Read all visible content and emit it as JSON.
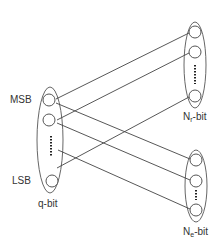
{
  "diagram": {
    "labels": {
      "msb": "MSB",
      "lsb": "LSB",
      "q_group": "q-bit",
      "nr_main": "N",
      "nr_sub": "r",
      "nr_suffix": "-bit",
      "ne_main": "N",
      "ne_sub": "e",
      "ne_suffix": "-bit"
    },
    "colors": {
      "stroke": "#555555",
      "line": "#444444",
      "text": "#333333",
      "background": "#ffffff"
    },
    "groups": [
      {
        "id": "q-bit",
        "cx": 50,
        "cy": 140,
        "rx": 13,
        "ry": 53,
        "nodes": [
          [
            49,
            100
          ],
          [
            49,
            120
          ],
          [
            52,
            181
          ]
        ],
        "dots": {
          "x": 51,
          "y1": 136,
          "y2": 157
        }
      },
      {
        "id": "nr-bit",
        "cx": 195,
        "cy": 65,
        "rx": 11,
        "ry": 43,
        "nodes": [
          [
            195,
            32
          ],
          [
            195,
            52
          ],
          [
            195,
            96
          ]
        ],
        "dots": {
          "x": 195,
          "y1": 65,
          "y2": 84
        }
      },
      {
        "id": "ne-bit",
        "cx": 196,
        "cy": 186,
        "rx": 11,
        "ry": 36,
        "nodes": [
          [
            196,
            160
          ],
          [
            196,
            181
          ],
          [
            196,
            210
          ]
        ],
        "dots": {
          "x": 196,
          "y1": 190,
          "y2": 200
        }
      }
    ],
    "connections": [
      {
        "from": [
          56,
          99
        ],
        "to": [
          189,
          33
        ]
      },
      {
        "from": [
          56,
          103
        ],
        "to": [
          190,
          159
        ]
      },
      {
        "from": [
          57,
          120
        ],
        "to": [
          189,
          53
        ]
      },
      {
        "from": [
          57,
          123
        ],
        "to": [
          190,
          180
        ]
      },
      {
        "from": [
          58,
          150
        ],
        "to": [
          190,
          209
        ]
      },
      {
        "from": [
          57,
          168
        ],
        "to": [
          189,
          97
        ]
      }
    ]
  }
}
